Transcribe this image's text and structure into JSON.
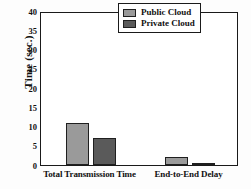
{
  "chart_data": {
    "type": "bar",
    "title": "",
    "xlabel": "",
    "ylabel": "Time (sec.)",
    "categories": [
      "Total Transmission Time",
      "End-to-End Delay"
    ],
    "series": [
      {
        "name": "Public Cloud",
        "values": [
          11,
          2
        ],
        "color": "#9a9a9a"
      },
      {
        "name": "Private Cloud",
        "values": [
          7,
          0.2
        ],
        "color": "#5a5a5a"
      }
    ],
    "ylim": [
      0,
      40
    ],
    "yticks": [
      0,
      5,
      10,
      15,
      20,
      25,
      30,
      35,
      40
    ],
    "ytick_labels": [
      "0",
      "5",
      "10",
      "15",
      "20",
      "25",
      "30",
      "35",
      "40"
    ],
    "grid": false,
    "legend_position": "top-right",
    "axis_color": "#1a1a1a"
  },
  "legend": {
    "entries": [
      {
        "label": "Public Cloud"
      },
      {
        "label": "Private Cloud"
      }
    ]
  }
}
